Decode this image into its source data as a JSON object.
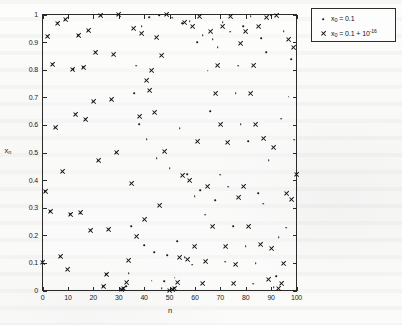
{
  "figure": {
    "kind": "scatter-plot",
    "background_color": "#fbfbfa",
    "axis_color": "#2b2b2b",
    "marker_color": "#111111"
  },
  "axes": {
    "xlabel": "n",
    "ylabel_base": "x",
    "ylabel_sub": "n",
    "xticks": [
      "0",
      "10",
      "20",
      "30",
      "40",
      "50",
      "60",
      "70",
      "80",
      "90",
      "100"
    ],
    "xtick_values": [
      0,
      10,
      20,
      30,
      40,
      50,
      60,
      70,
      80,
      90,
      100
    ],
    "yticks": [
      "0",
      "0.1",
      "0.2",
      "0.3",
      "0.4",
      "0.5",
      "0.6",
      "0.7",
      "0.8",
      "0.9",
      "1"
    ],
    "ytick_values": [
      0,
      0.1,
      0.2,
      0.3,
      0.4,
      0.5,
      0.6,
      0.7,
      0.8,
      0.9,
      1
    ]
  },
  "legend": {
    "position": "outside-top-right",
    "entries": [
      {
        "marker": "dot",
        "label_base": "x",
        "label_sub": "0",
        "label_rest": " = 0.1",
        "label_sup": "",
        "full_text": "x0 = 0.1"
      },
      {
        "marker": "cross",
        "label_base": "x",
        "label_sub": "0",
        "label_rest": " = 0.1 + 10",
        "label_sup": "-16",
        "full_text": "x0 = 0.1 + 10^-16"
      }
    ]
  },
  "chart_data": {
    "type": "scatter",
    "title": "",
    "xlabel": "n",
    "ylabel": "x_n",
    "xlim": [
      0,
      100
    ],
    "ylim": [
      0,
      1
    ],
    "grid": false,
    "legend_position": "outside-top-right",
    "xticks": [
      0,
      10,
      20,
      30,
      40,
      50,
      60,
      70,
      80,
      90,
      100
    ],
    "yticks": [
      0,
      0.1,
      0.2,
      0.3,
      0.4,
      0.5,
      0.6,
      0.7,
      0.8,
      0.9,
      1
    ],
    "x": [
      0,
      1,
      2,
      3,
      4,
      5,
      6,
      7,
      8,
      9,
      10,
      11,
      12,
      13,
      14,
      15,
      16,
      17,
      18,
      19,
      20,
      21,
      22,
      23,
      24,
      25,
      26,
      27,
      28,
      29,
      30,
      31,
      32,
      33,
      34,
      35,
      36,
      37,
      38,
      39,
      40,
      41,
      42,
      43,
      44,
      45,
      46,
      47,
      48,
      49,
      50,
      51,
      52,
      53,
      54,
      55,
      56,
      57,
      58,
      59,
      60,
      61,
      62,
      63,
      64,
      65,
      66,
      67,
      68,
      69,
      70,
      71,
      72,
      73,
      74,
      75,
      76,
      77,
      78,
      79,
      80,
      81,
      82,
      83,
      84,
      85,
      86,
      87,
      88,
      89,
      90,
      91,
      92,
      93,
      94,
      95,
      96,
      97,
      98,
      99,
      100
    ],
    "series": [
      {
        "name": "x0 = 0.1",
        "marker": "dot",
        "values": [
          0.1,
          0.36,
          0.922,
          0.288,
          0.82,
          0.59,
          0.968,
          0.123,
          0.431,
          0.981,
          0.075,
          0.277,
          0.801,
          0.638,
          0.924,
          0.281,
          0.808,
          0.62,
          0.942,
          0.219,
          0.684,
          0.864,
          0.47,
          0.996,
          0.015,
          0.059,
          0.222,
          0.691,
          0.854,
          0.499,
          1.0,
          0.001,
          0.004,
          0.016,
          0.062,
          0.233,
          0.715,
          0.815,
          0.603,
          0.957,
          0.164,
          0.548,
          0.991,
          0.036,
          0.139,
          0.479,
          0.998,
          0.008,
          0.033,
          0.127,
          0.444,
          0.988,
          0.047,
          0.179,
          0.588,
          0.969,
          0.12,
          0.422,
          0.976,
          0.094,
          0.341,
          0.899,
          0.364,
          0.926,
          0.274,
          0.796,
          0.65,
          0.91,
          0.328,
          0.881,
          0.419,
          0.973,
          0.105,
          0.376,
          0.938,
          0.233,
          0.715,
          0.815,
          0.602,
          0.958,
          0.161,
          0.54,
          0.994,
          0.025,
          0.098,
          0.353,
          0.914,
          0.315,
          0.863,
          0.473,
          0.997,
          0.013,
          0.051,
          0.193,
          0.623,
          0.94,
          0.227,
          0.702,
          0.837,
          0.546,
          0.992
        ]
      },
      {
        "name": "x0 = 0.1 + 1e-16",
        "marker": "cross",
        "values": [
          0.1,
          0.36,
          0.922,
          0.288,
          0.82,
          0.59,
          0.968,
          0.123,
          0.431,
          0.981,
          0.075,
          0.277,
          0.801,
          0.638,
          0.924,
          0.281,
          0.808,
          0.62,
          0.942,
          0.219,
          0.684,
          0.864,
          0.47,
          0.996,
          0.015,
          0.059,
          0.222,
          0.691,
          0.854,
          0.499,
          1.0,
          0.002,
          0.007,
          0.028,
          0.108,
          0.386,
          0.948,
          0.197,
          0.632,
          0.931,
          0.256,
          0.762,
          0.725,
          0.798,
          0.645,
          0.916,
          0.308,
          0.853,
          0.502,
          1.0,
          0.0,
          0.002,
          0.008,
          0.03,
          0.118,
          0.415,
          0.971,
          0.112,
          0.398,
          0.958,
          0.161,
          0.541,
          0.993,
          0.027,
          0.105,
          0.376,
          0.938,
          0.233,
          0.715,
          0.815,
          0.602,
          0.958,
          0.16,
          0.538,
          0.994,
          0.024,
          0.093,
          0.338,
          0.895,
          0.376,
          0.938,
          0.233,
          0.715,
          0.815,
          0.603,
          0.957,
          0.165,
          0.551,
          0.99,
          0.04,
          0.153,
          0.518,
          0.998,
          0.006,
          0.025,
          0.097,
          0.35,
          0.91,
          0.328,
          0.881,
          0.42
        ]
      }
    ]
  }
}
